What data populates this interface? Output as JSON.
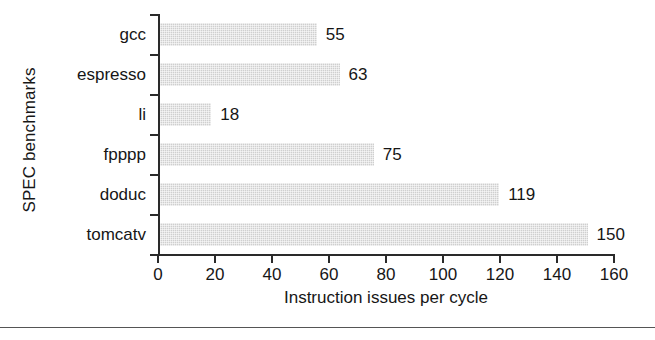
{
  "chart_data": {
    "type": "bar",
    "orientation": "horizontal",
    "title": "",
    "xlabel": "Instruction issues per cycle",
    "ylabel": "SPEC benchmarks",
    "categories": [
      "gcc",
      "espresso",
      "li",
      "fpppp",
      "doduc",
      "tomcatv"
    ],
    "values": [
      55,
      63,
      18,
      75,
      119,
      150
    ],
    "value_labels": [
      "55",
      "63",
      "18",
      "75",
      "119",
      "150"
    ],
    "xlim": [
      0,
      160
    ],
    "xticks": [
      0,
      20,
      40,
      60,
      80,
      100,
      120,
      140,
      160
    ],
    "xtick_labels": [
      "0",
      "20",
      "40",
      "60",
      "80",
      "100",
      "120",
      "140",
      "160"
    ],
    "grid": false,
    "legend": null,
    "bar_color": "#cfcfcf",
    "axis_color": "#2a2a2a",
    "text_color": "#161616"
  },
  "figure": {
    "background": "#ffffff",
    "rule_color": "#555555"
  }
}
